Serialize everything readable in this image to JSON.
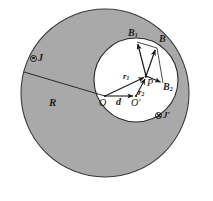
{
  "figure": {
    "background_color": "#ffffff",
    "outer_disk": {
      "name": "outer-conductor-disk",
      "fill_color": "#a9a9a9",
      "stroke_color": "#3b3b3b",
      "center_x": 105,
      "center_y": 93,
      "radius": 84
    },
    "inner_disk": {
      "name": "inner-cavity-disk",
      "fill_color": "#ffffff",
      "stroke_color": "#2b2b2b",
      "center_x": 136,
      "center_y": 80,
      "radius": 42
    },
    "points": {
      "O": {
        "label": "O",
        "x": 104,
        "y": 95
      },
      "Oprime": {
        "label": "O′",
        "x": 136,
        "y": 95
      },
      "P": {
        "label": "P",
        "x": 146,
        "y": 76
      }
    },
    "labels": {
      "radius_R": "R",
      "separation_d": "d",
      "r1": "r",
      "r1_sub": "1",
      "r2": "r",
      "r2_sub": "2",
      "point_O": "O",
      "point_O_prime": "O′",
      "point_P": "P",
      "field_B": "B",
      "field_B1": "B",
      "field_B1_sub": "1",
      "field_B2": "B",
      "field_B2_sub": "2",
      "current_J": "J",
      "current_J_prime": "J′"
    },
    "current_markers": [
      {
        "name": "current-density-j-out-of-page",
        "glyph": "circle-dot",
        "label": "J",
        "x": 34,
        "y": 55,
        "description": "current density out of page"
      },
      {
        "name": "current-density-j-prime-into-page",
        "glyph": "circle-cross",
        "label": "J′",
        "x": 157,
        "y": 113,
        "description": "current density into page"
      }
    ],
    "vectors": [
      {
        "name": "vector-R",
        "label": "R",
        "from_x": 24,
        "from_y": 72,
        "to_x": 104,
        "to_y": 96,
        "arrow": false
      },
      {
        "name": "vector-d",
        "label": "d",
        "from_x": 105,
        "from_y": 96,
        "to_x": 134,
        "to_y": 96,
        "arrow": true
      },
      {
        "name": "vector-r1",
        "label": "r1",
        "from_x": 105,
        "from_y": 96,
        "to_x": 145,
        "to_y": 77,
        "arrow": true
      },
      {
        "name": "vector-r2",
        "label": "r2",
        "from_x": 136,
        "from_y": 96,
        "to_x": 146,
        "to_y": 78,
        "arrow": true
      },
      {
        "name": "vector-B1",
        "label": "B1",
        "from_x": 146,
        "from_y": 76,
        "to_x": 137,
        "to_y": 41,
        "arrow": true
      },
      {
        "name": "vector-B2",
        "label": "B2",
        "from_x": 146,
        "from_y": 76,
        "to_x": 163,
        "to_y": 83,
        "arrow": true
      },
      {
        "name": "vector-B-resultant",
        "label": "B",
        "from_x": 146,
        "from_y": 76,
        "to_x": 156,
        "to_y": 47,
        "arrow": true
      },
      {
        "name": "parallelogram-side-upper",
        "from_x": 137,
        "from_y": 41,
        "to_x": 157,
        "to_y": 47,
        "arrow": false
      },
      {
        "name": "parallelogram-side-right",
        "from_x": 163,
        "from_y": 83,
        "to_x": 157,
        "to_y": 47,
        "arrow": false
      }
    ]
  }
}
